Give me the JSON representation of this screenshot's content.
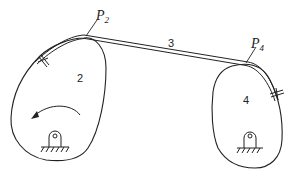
{
  "diagram": {
    "type": "mechanism",
    "labels": {
      "body_left": "2",
      "link": "3",
      "body_right": "4",
      "point_left_main": "P",
      "point_left_sub": "2",
      "point_right_main": "P",
      "point_right_sub": "4"
    },
    "elements": [
      {
        "id": "body-2",
        "label": "2",
        "kind": "rotating cam body",
        "pivot": "fixed ground pin"
      },
      {
        "id": "link-3",
        "label": "3",
        "kind": "flexible band"
      },
      {
        "id": "body-4",
        "label": "4",
        "kind": "rotating cam body",
        "pivot": "fixed ground pin"
      }
    ],
    "annotations": {
      "rotation_arrow": "counter-clockwise on body 2",
      "attachment_marks": "crossed ticks where band is fixed to each body"
    },
    "colors": {
      "stroke": "#222222",
      "background": "#ffffff"
    }
  }
}
